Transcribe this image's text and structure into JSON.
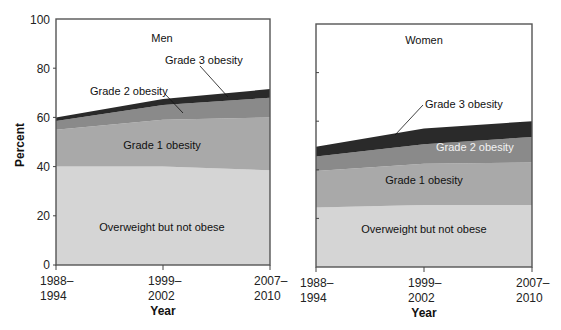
{
  "chart_data": [
    {
      "type": "area",
      "stacked": true,
      "title": "Men",
      "xlabel": "Year",
      "ylabel": "Percent",
      "ylim": [
        0,
        100
      ],
      "yticks": [
        0,
        20,
        40,
        60,
        80,
        100
      ],
      "categories": [
        "1988–1994",
        "1999–2002",
        "2007–2010"
      ],
      "series": [
        {
          "name": "Overweight but not obese",
          "values": [
            40.0,
            40.0,
            38.5
          ],
          "color": "#d5d5d5"
        },
        {
          "name": "Grade 1 obesity",
          "values": [
            15.0,
            19.0,
            21.5
          ],
          "color": "#a9a9a9"
        },
        {
          "name": "Grade 2 obesity",
          "values": [
            3.5,
            6.0,
            8.0
          ],
          "color": "#8a8a8a"
        },
        {
          "name": "Grade 3 obesity",
          "values": [
            1.5,
            2.5,
            3.5
          ],
          "color": "#2a2a2a"
        }
      ],
      "annotations": [
        {
          "text": "Men"
        },
        {
          "text": "Grade 3 obesity"
        },
        {
          "text": "Grade 2 obesity"
        },
        {
          "text": "Grade 1 obesity"
        },
        {
          "text": "Overweight but not obese"
        }
      ]
    },
    {
      "type": "area",
      "stacked": true,
      "title": "Women",
      "xlabel": "Year",
      "ylabel": "Percent",
      "ylim": [
        0,
        100
      ],
      "yticks": [
        0,
        20,
        40,
        60,
        80,
        100
      ],
      "categories": [
        "1988–1994",
        "1999–2002",
        "2007–2010"
      ],
      "series": [
        {
          "name": "Overweight but not obese",
          "values": [
            24.5,
            25.5,
            25.5
          ],
          "color": "#d5d5d5"
        },
        {
          "name": "Grade 1 obesity",
          "values": [
            15.0,
            17.0,
            17.5
          ],
          "color": "#a9a9a9"
        },
        {
          "name": "Grade 2 obesity",
          "values": [
            6.0,
            8.0,
            10.5
          ],
          "color": "#8a8a8a"
        },
        {
          "name": "Grade 3 obesity",
          "values": [
            4.0,
            6.5,
            6.5
          ],
          "color": "#2a2a2a"
        }
      ],
      "annotations": [
        {
          "text": "Women"
        },
        {
          "text": "Grade 3 obesity"
        },
        {
          "text": "Grade 2 obesity"
        },
        {
          "text": "Grade 1 obesity"
        },
        {
          "text": "Overweight but not obese"
        }
      ]
    }
  ],
  "labels": {
    "ylabel": "Percent",
    "xlabel": "Year",
    "men_title": "Men",
    "women_title": "Women",
    "grade3": "Grade 3 obesity",
    "grade2": "Grade 2 obesity",
    "grade1": "Grade 1 obesity",
    "overweight": "Overweight but not obese",
    "x_ticks": [
      {
        "line1": "1988–",
        "line2": "1994"
      },
      {
        "line1": "1999–",
        "line2": "2002"
      },
      {
        "line1": "2007–",
        "line2": "2010"
      }
    ],
    "y_ticks": [
      "0",
      "20",
      "40",
      "60",
      "80",
      "100"
    ]
  }
}
